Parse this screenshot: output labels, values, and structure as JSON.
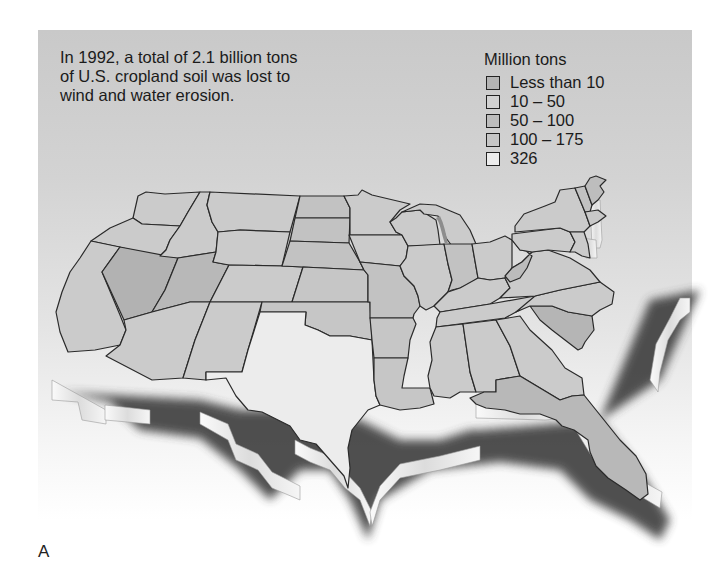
{
  "figure": {
    "caption": "In 1992, a total of 2.1 billion tons of U.S. cropland soil was lost to wind and water erosion.",
    "caption_lines": [
      "In 1992, a total of 2.1 billion tons",
      "of U.S. cropland soil was lost to",
      "wind and water erosion."
    ],
    "label": "A"
  },
  "legend": {
    "title": "Million tons",
    "items": [
      {
        "label": "Less than 10",
        "color": "#b4b4b4"
      },
      {
        "label": "10 – 50",
        "color": "#cfcfcf"
      },
      {
        "label": "50 – 100",
        "color": "#bdbdbd"
      },
      {
        "label": "100 – 175",
        "color": "#c6c6c6"
      },
      {
        "label": "326",
        "color": "#ececec"
      }
    ]
  },
  "map": {
    "title": "U.S. cropland soil erosion by state, 1992",
    "colors": {
      "panel_top": "#c9c9c9",
      "state_default": "#cbcbcb",
      "state_dark": "#b2b2b2",
      "state_mid": "#bfbfbf",
      "state_light": "#d6d6d6",
      "texas": "#ececec",
      "outline": "#2a2a2a",
      "extrusion": "#f2f2f2",
      "shadow": "#3a3a3a"
    },
    "highlight": {
      "state": "Texas",
      "value": "326"
    }
  }
}
